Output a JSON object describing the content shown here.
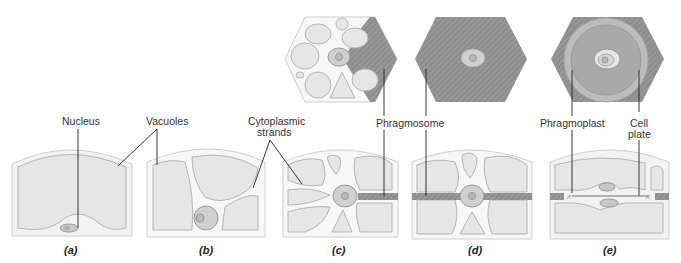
{
  "labels": {
    "nucleus": "Nucleus",
    "vacuoles": "Vacuoles",
    "cytoplasmic_strands_1": "Cytoplasmic",
    "cytoplasmic_strands_2": "strands",
    "phragmosome": "Phragmosome",
    "phragmoplast": "Phragmoplast",
    "cell_plate_1": "Cell",
    "cell_plate_2": "plate"
  },
  "panels": [
    {
      "id": "a",
      "label": "(a)"
    },
    {
      "id": "b",
      "label": "(b)"
    },
    {
      "id": "c",
      "label": "(c)"
    },
    {
      "id": "d",
      "label": "(d)"
    },
    {
      "id": "e",
      "label": "(e)"
    }
  ],
  "colors": {
    "wall": "#f2f2f2",
    "wall_stroke": "#c8c8c8",
    "cytoplasm": "#f7f7f7",
    "vacuole": "#e6e6e6",
    "vacuole_stroke": "#b5b5b5",
    "phragmosome": "#8c8c8c",
    "nucleus": "#d0d0d0",
    "line": "#222222"
  }
}
